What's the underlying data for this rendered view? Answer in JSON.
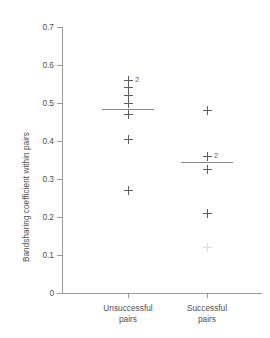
{
  "chart_data": {
    "type": "scatter",
    "title": "",
    "xlabel": "",
    "ylabel": "Bandsharing coefficient within pairs",
    "ylim": [
      0,
      0.7
    ],
    "ytick_labels": [
      "0.7",
      "0.6",
      "0.5",
      "0.4",
      "0.3",
      "0.2",
      "0.1",
      "0"
    ],
    "ytick_values": [
      0.7,
      0.6,
      0.5,
      0.4,
      0.3,
      0.2,
      0.1,
      0
    ],
    "grid": false,
    "legend": "none",
    "categories": [
      "Unsuccessful pairs",
      "Successful pairs"
    ],
    "group_labels": [
      {
        "line1": "Unsuccessful",
        "line2": "pairs"
      },
      {
        "line1": "Successful",
        "line2": "pairs"
      }
    ],
    "series": [
      {
        "name": "Unsuccessful pairs",
        "mean": 0.485,
        "points": [
          {
            "value": 0.56,
            "count": 2,
            "count_label": "2"
          },
          {
            "value": 0.54,
            "count": 1,
            "count_label": ""
          },
          {
            "value": 0.52,
            "count": 1,
            "count_label": ""
          },
          {
            "value": 0.5,
            "count": 1,
            "count_label": ""
          },
          {
            "value": 0.47,
            "count": 1,
            "count_label": ""
          },
          {
            "value": 0.405,
            "count": 1,
            "count_label": ""
          },
          {
            "value": 0.27,
            "count": 1,
            "count_label": ""
          }
        ]
      },
      {
        "name": "Successful pairs",
        "mean": 0.345,
        "points": [
          {
            "value": 0.48,
            "count": 1,
            "count_label": ""
          },
          {
            "value": 0.36,
            "count": 2,
            "count_label": "2"
          },
          {
            "value": 0.325,
            "count": 1,
            "count_label": ""
          },
          {
            "value": 0.21,
            "count": 1,
            "count_label": ""
          },
          {
            "value": 0.12,
            "count": 1,
            "count_label": "",
            "faint": true
          }
        ]
      }
    ]
  }
}
